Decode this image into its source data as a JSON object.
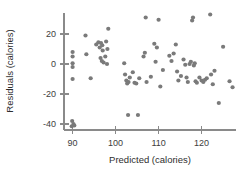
{
  "chart_data": {
    "type": "scatter",
    "title": "",
    "xlabel": "Predicted (calories)",
    "ylabel": "Residuals (calories)",
    "xlim": [
      88,
      128
    ],
    "ylim": [
      -44,
      34
    ],
    "grid": false,
    "legend": null,
    "xticks": [
      90,
      100,
      110,
      120
    ],
    "xticklabels": [
      "90",
      "100",
      "110",
      "120"
    ],
    "yticks": [
      20,
      0,
      -20,
      -40
    ],
    "yticklabels": [
      "20",
      "0",
      "-20",
      "-40"
    ],
    "marker": {
      "shape": "circle",
      "color": "#7a7a7a",
      "size": 4.2
    },
    "points": [
      [
        90.0,
        8.0
      ],
      [
        90.0,
        5.0
      ],
      [
        90.0,
        0.5
      ],
      [
        90.0,
        -2.0
      ],
      [
        90.0,
        -10.0
      ],
      [
        89.9,
        -38.0
      ],
      [
        90.2,
        -40.0
      ],
      [
        90.4,
        -41.0
      ],
      [
        89.8,
        -41.5
      ],
      [
        93.0,
        19.0
      ],
      [
        93.2,
        6.5
      ],
      [
        94.2,
        -9.5
      ],
      [
        95.5,
        13.0
      ],
      [
        96.0,
        14.5
      ],
      [
        96.3,
        11.0
      ],
      [
        96.6,
        14.0
      ],
      [
        96.9,
        12.5
      ],
      [
        97.0,
        9.0
      ],
      [
        96.5,
        4.0
      ],
      [
        96.8,
        2.0
      ],
      [
        97.2,
        1.0
      ],
      [
        97.6,
        5.0
      ],
      [
        97.8,
        15.0
      ],
      [
        98.0,
        0.0
      ],
      [
        98.3,
        23.5
      ],
      [
        98.1,
        10.0
      ],
      [
        102.0,
        0.5
      ],
      [
        102.2,
        -7.0
      ],
      [
        102.5,
        -11.0
      ],
      [
        102.7,
        -13.0
      ],
      [
        103.0,
        -12.0
      ],
      [
        103.3,
        -9.0
      ],
      [
        102.9,
        -34.0
      ],
      [
        104.0,
        -5.5
      ],
      [
        104.4,
        -12.5
      ],
      [
        104.8,
        -13.0
      ],
      [
        105.2,
        -34.0
      ],
      [
        105.5,
        -9.5
      ],
      [
        106.5,
        5.0
      ],
      [
        106.8,
        7.5
      ],
      [
        107.0,
        31.0
      ],
      [
        107.2,
        -12.0
      ],
      [
        108.2,
        -8.5
      ],
      [
        109.0,
        13.5
      ],
      [
        109.3,
        1.5
      ],
      [
        109.6,
        11.0
      ],
      [
        110.0,
        29.5
      ],
      [
        110.4,
        -15.0
      ],
      [
        111.0,
        -4.0
      ],
      [
        112.5,
        5.5
      ],
      [
        113.0,
        2.0
      ],
      [
        113.5,
        7.0
      ],
      [
        114.0,
        13.0
      ],
      [
        114.3,
        -5.0
      ],
      [
        114.6,
        -11.0
      ],
      [
        115.2,
        -8.0
      ],
      [
        115.8,
        3.0
      ],
      [
        116.2,
        -0.5
      ],
      [
        116.5,
        -9.0
      ],
      [
        116.8,
        -12.0
      ],
      [
        117.2,
        0.0
      ],
      [
        117.5,
        1.5
      ],
      [
        117.8,
        29.0
      ],
      [
        118.0,
        31.0
      ],
      [
        118.2,
        -1.0
      ],
      [
        118.4,
        0.5
      ],
      [
        118.6,
        -11.5
      ],
      [
        118.9,
        -12.5
      ],
      [
        119.5,
        -9.0
      ],
      [
        120.0,
        -11.0
      ],
      [
        120.4,
        -12.0
      ],
      [
        120.8,
        -10.5
      ],
      [
        121.2,
        -9.5
      ],
      [
        122.0,
        33.0
      ],
      [
        122.2,
        -7.0
      ],
      [
        122.6,
        -13.5
      ],
      [
        123.0,
        -4.5
      ],
      [
        124.0,
        -26.0
      ],
      [
        125.0,
        11.5
      ],
      [
        126.5,
        -11.5
      ],
      [
        127.2,
        -15.5
      ]
    ]
  },
  "axes": {
    "x_title": "Predicted (calories)",
    "y_title": "Residuals (calories)"
  }
}
